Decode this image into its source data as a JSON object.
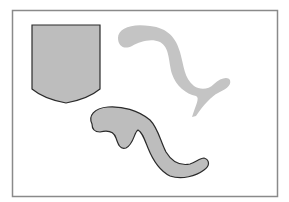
{
  "figure": {
    "frame": {
      "stroke": "#8a8a8a",
      "fill": "#ffffff"
    },
    "shapes": [
      {
        "name": "shield-shape",
        "fill": "#bdbdbd",
        "stroke": "#2b2b2b",
        "outlined": true
      },
      {
        "name": "gray-squiggle-shape",
        "fill": "#c4c4c4",
        "stroke": "none",
        "outlined": false
      },
      {
        "name": "outlined-squiggle-shape",
        "fill": "#bdbdbd",
        "stroke": "#2b2b2b",
        "outlined": true
      }
    ]
  }
}
